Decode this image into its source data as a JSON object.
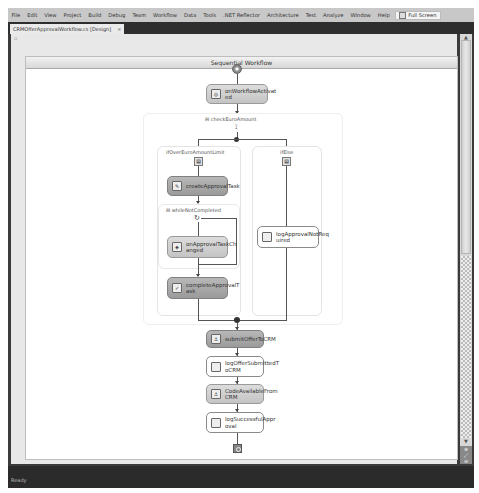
{
  "menubar": {
    "items": [
      "File",
      "Edit",
      "View",
      "Project",
      "Build",
      "Debug",
      "Team",
      "Workflow",
      "Data",
      "Tools",
      ".NET Reflector",
      "Architecture",
      "Test",
      "Analyze",
      "Window",
      "Help"
    ],
    "full_screen_label": "Full Screen"
  },
  "tabs": [
    {
      "label": "CRMOfferApprovalWorkflow.cs [Design]",
      "close": "×",
      "active": true
    }
  ],
  "designer": {
    "header_title": "Sequential Workflow",
    "activities": {
      "on_workflow_activated": "onWorkflowActivat\ned",
      "check_euro_amount": "checkEuroAmount",
      "branch_if_over": "ifOverEuroAmountLimit",
      "branch_else": "ifElse",
      "create_approval_task": "createApprovalTask",
      "while_task_completed": "whileNotCompleted",
      "on_approval_task_changed": "onApprovalTaskCh\nanged",
      "complete_approval_task": "completeApprovalT\nask",
      "log_approval_not_required": "logApprovalNotReq\nuired",
      "submit_offer_to_crm": "submitOfferToCRM",
      "log_offer_submitted": "logOfferSubmittedT\noCRM",
      "code_available_from_crm": "CodeAvailableFrom\nCRM",
      "log_successful_approval": "logSuccessfulAppr\noval"
    }
  },
  "scrollbar": {
    "up": "▲",
    "down": "▼"
  },
  "zoom_controls": [
    "⊕",
    "⤢",
    "⊖"
  ],
  "status": {
    "text": "Ready"
  }
}
